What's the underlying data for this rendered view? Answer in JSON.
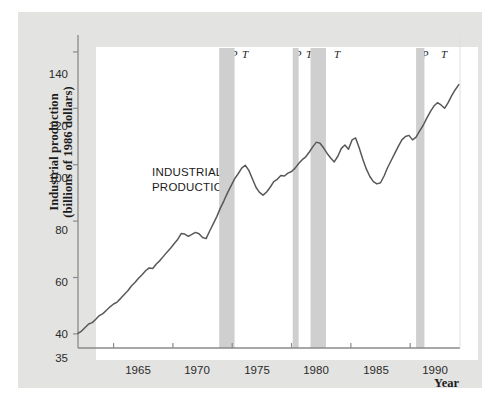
{
  "chart_data": {
    "type": "line",
    "title": "",
    "subtitle": "",
    "xlabel": "Year",
    "ylabel": "Industrial production (billions of 1986 dollars)",
    "ylabel_line1": "Industrial production",
    "ylabel_line2": "(billions of 1986 dollars)",
    "annotation": "INDUSTRIAL PRODUCTION",
    "annotation_line1": "INDUSTRIAL",
    "annotation_line2": "PRODUCTION",
    "grid": false,
    "legend": "none",
    "xlim": [
      1962.0,
      1994.2
    ],
    "ylim": [
      35,
      146
    ],
    "xticks": [
      1965,
      1970,
      1975,
      1980,
      1985,
      1990
    ],
    "xtick_labels": [
      "1965",
      "1970",
      "1975",
      "1980",
      "1985",
      "1990"
    ],
    "yticks": [
      40,
      60,
      80,
      100,
      120,
      140
    ],
    "ytick_labels": [
      "40",
      "60",
      "80",
      "100",
      "120",
      "140"
    ],
    "y_axis_origin_label": "35",
    "line_color": "#58585a",
    "band_color": "#cfcfcf",
    "panel_color": "#e3e3e1",
    "plot_bg_color": "#ffffff",
    "axis_color": "#8a8a8a",
    "series": [
      {
        "name": "Industrial production",
        "x": [
          1962.0,
          1962.3,
          1962.6,
          1962.9,
          1963.2,
          1963.5,
          1963.8,
          1964.1,
          1964.4,
          1964.7,
          1965.0,
          1965.3,
          1965.6,
          1965.9,
          1966.2,
          1966.5,
          1966.8,
          1967.1,
          1967.4,
          1967.7,
          1968.0,
          1968.3,
          1968.6,
          1968.9,
          1969.2,
          1969.5,
          1969.8,
          1970.1,
          1970.4,
          1970.7,
          1971.0,
          1971.3,
          1971.6,
          1971.9,
          1972.2,
          1972.5,
          1972.8,
          1973.1,
          1973.4,
          1973.7,
          1974.0,
          1974.3,
          1974.6,
          1974.9,
          1975.2,
          1975.5,
          1975.8,
          1976.1,
          1976.4,
          1976.7,
          1977.0,
          1977.3,
          1977.6,
          1977.9,
          1978.2,
          1978.5,
          1978.8,
          1979.1,
          1979.4,
          1979.7,
          1980.0,
          1980.3,
          1980.6,
          1980.9,
          1981.2,
          1981.5,
          1981.8,
          1982.1,
          1982.4,
          1982.7,
          1983.0,
          1983.3,
          1983.6,
          1983.9,
          1984.2,
          1984.5,
          1984.8,
          1985.1,
          1985.4,
          1985.7,
          1986.0,
          1986.3,
          1986.6,
          1986.9,
          1987.2,
          1987.5,
          1987.8,
          1988.1,
          1988.4,
          1988.7,
          1989.0,
          1989.3,
          1989.6,
          1989.9,
          1990.2,
          1990.5,
          1990.8,
          1991.1,
          1991.4,
          1991.7,
          1992.0,
          1992.3,
          1992.6,
          1992.9,
          1993.2,
          1993.5,
          1993.8,
          1994.1
        ],
        "values": [
          40.2,
          41.0,
          42.3,
          43.5,
          44.0,
          45.2,
          46.5,
          47.2,
          48.4,
          49.6,
          50.6,
          51.3,
          52.6,
          54.0,
          55.3,
          57.0,
          58.2,
          59.7,
          61.0,
          62.4,
          63.4,
          63.2,
          64.8,
          66.0,
          67.5,
          69.0,
          70.4,
          72.0,
          73.5,
          75.6,
          75.4,
          74.6,
          75.3,
          76.0,
          75.5,
          74.2,
          73.8,
          76.5,
          79.0,
          81.6,
          84.6,
          87.2,
          90.0,
          92.5,
          95.0,
          96.8,
          98.8,
          99.8,
          98.0,
          95.0,
          92.0,
          90.2,
          89.2,
          90.3,
          92.0,
          94.0,
          94.8,
          96.2,
          96.0,
          97.0,
          97.6,
          98.8,
          100.4,
          101.8,
          102.8,
          104.5,
          106.4,
          108.0,
          107.6,
          106.0,
          104.0,
          102.4,
          101.0,
          103.0,
          105.8,
          107.0,
          105.5,
          108.8,
          109.5,
          106.0,
          102.0,
          98.5,
          95.8,
          94.0,
          93.2,
          93.6,
          96.0,
          99.0,
          101.5,
          104.0,
          106.5,
          108.8,
          110.0,
          110.4,
          108.8,
          109.8,
          112.0,
          114.0,
          116.5,
          118.8,
          120.8,
          122.0,
          121.2,
          120.0,
          122.0,
          124.5,
          126.6,
          128.4
        ]
      }
    ],
    "recession_bands": [
      {
        "peak_year": 1973.9,
        "trough_year": 1975.2,
        "peak_label": "P",
        "trough_label": "T"
      },
      {
        "peak_year": 1980.1,
        "trough_year": 1980.6,
        "peak_label": "P",
        "trough_label": "T"
      },
      {
        "peak_year": 1981.6,
        "trough_year": 1982.9,
        "peak_label": "P",
        "trough_label": "T"
      },
      {
        "peak_year": 1990.5,
        "trough_year": 1991.2,
        "peak_label": "P",
        "trough_label": "T"
      }
    ]
  }
}
